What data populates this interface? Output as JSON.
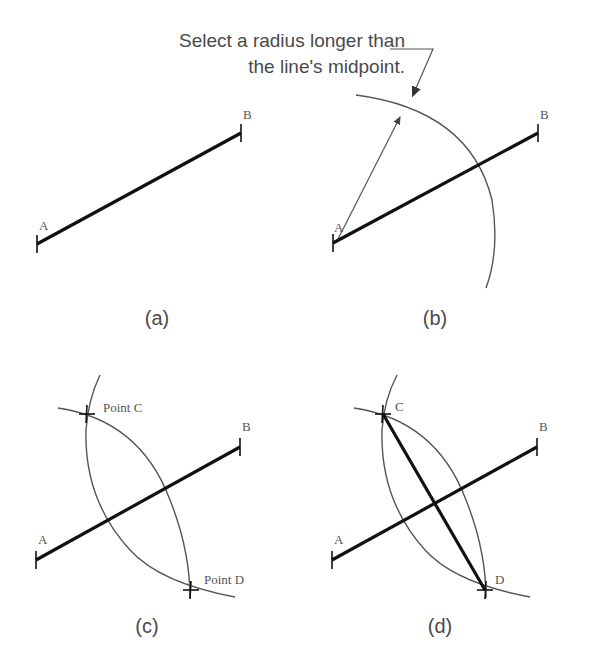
{
  "callout": {
    "line1": "Select a radius longer than",
    "line2": "the line's midpoint."
  },
  "panels": {
    "a": {
      "caption": "(a)",
      "label_a": "A",
      "label_b": "B"
    },
    "b": {
      "caption": "(b)",
      "label_a": "A",
      "label_b": "B"
    },
    "c": {
      "caption": "(c)",
      "label_a": "A",
      "label_b": "B",
      "label_c": "Point C",
      "label_d": "Point D"
    },
    "d": {
      "caption": "(d)",
      "label_a": "A",
      "label_b": "B",
      "label_c": "C",
      "label_d": "D"
    }
  },
  "colors": {
    "segment": "#111111",
    "arc": "#555555",
    "text": "#4a4a4a"
  }
}
